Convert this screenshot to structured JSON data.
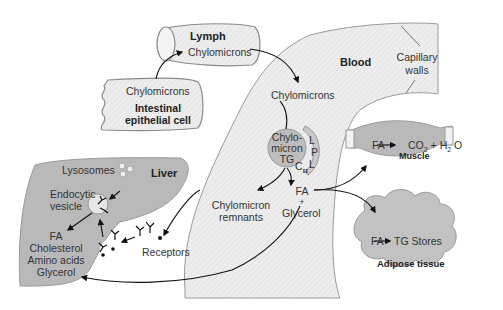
{
  "diagram": {
    "regions": {
      "lymph": {
        "title": "Lymph",
        "content": "Chylomicrons"
      },
      "intestinal_cell": {
        "content": "Chylomicrons",
        "title_line1": "Intestinal",
        "title_line2": "epithelial cell"
      },
      "blood": {
        "title": "Blood",
        "chylomicrons": "Chylomicrons",
        "capillary_line1": "Capillary",
        "capillary_line2": "walls"
      },
      "chylomicron_tg": {
        "line1": "Chylo-",
        "line2": "micron",
        "line3": "TG",
        "apo": "C",
        "apo_sub": "II"
      },
      "lpl": {
        "l1": "L",
        "p": "P",
        "l2": "L"
      },
      "products": {
        "fa": "FA",
        "plus": "+",
        "glycerol": "Glycerol"
      },
      "remnants": {
        "line1": "Chylomicron",
        "line2": "remnants"
      },
      "liver": {
        "title": "Liver",
        "lysosomes": "Lysosomes",
        "vesicle_line1": "Endocytic",
        "vesicle_line2": "vesicle",
        "receptors": "Receptors",
        "outputs": [
          "FA",
          "Cholesterol",
          "Amino acids",
          "Glycerol"
        ]
      },
      "muscle": {
        "title": "Muscle",
        "reaction_fa": "FA",
        "reaction_co2": "CO",
        "co2_sub": "2",
        "plus": "+",
        "h2o_h": "H",
        "h2o_sub": "2",
        "h2o_o": "O"
      },
      "adipose": {
        "title": "Adipose tissue",
        "reaction_fa": "FA",
        "reaction_product": "TG Stores"
      }
    },
    "colors": {
      "blood_fill": "#ececec",
      "organ_fill": "#b5b5b5",
      "outline": "#8a8a8a",
      "arrow": "#111111"
    }
  }
}
